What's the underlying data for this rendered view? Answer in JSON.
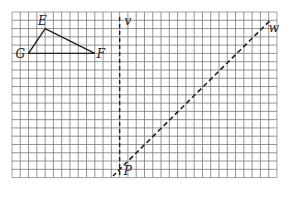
{
  "figure": {
    "grid": {
      "columns": 32,
      "rows": 20,
      "origin_px": [
        12,
        12
      ],
      "cell_px": 8.28,
      "line_color": "#7a7a7a",
      "border_color": "#8a8a8a"
    },
    "triangle": {
      "stroke": "#222222",
      "vertices": [
        {
          "name": "E",
          "label": "E",
          "gx": 4,
          "gy": 2,
          "label_dx": -7,
          "label_dy": -4
        },
        {
          "name": "F",
          "label": "F",
          "gx": 10,
          "gy": 5,
          "label_dx": 2,
          "label_dy": 5
        },
        {
          "name": "G",
          "label": "G",
          "gx": 2,
          "gy": 5,
          "label_dx": -13,
          "label_dy": 5
        }
      ]
    },
    "lines": [
      {
        "name": "v",
        "label": "v",
        "style": "dashed",
        "x1": 13,
        "y1": 0.6,
        "x2": 13,
        "y2": 20,
        "label_gx": 13.6,
        "label_gy": 1.6
      },
      {
        "name": "w",
        "label": "w",
        "style": "dashed",
        "x1": 31.1,
        "y1": 1.1,
        "x2": 12.2,
        "y2": 19.8,
        "label_gx": 31.0,
        "label_gy": 2.4
      }
    ],
    "points": [
      {
        "name": "P",
        "label": "P",
        "gx": 13,
        "gy": 19,
        "label_gx": 13.5,
        "label_gy": 19.7
      }
    ]
  }
}
